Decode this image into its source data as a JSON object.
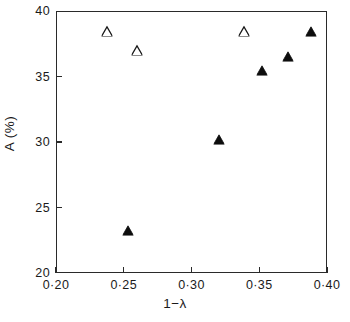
{
  "chart_data": {
    "type": "scatter",
    "title": "",
    "subtitle": "",
    "xlabel": "1−λ",
    "ylabel": "A (%)",
    "xlim": [
      0.2,
      0.4
    ],
    "ylim": [
      20,
      40
    ],
    "xticks": [
      0.2,
      0.25,
      0.3,
      0.35,
      0.4
    ],
    "yticks": [
      20,
      25,
      30,
      35,
      40
    ],
    "xticklabels": [
      "0·20",
      "0·25",
      "0·30",
      "0·35",
      "0·40"
    ],
    "yticklabels": [
      "20",
      "25",
      "30",
      "35",
      "40"
    ],
    "grid": false,
    "legend": "none",
    "series": [
      {
        "name": "open-triangle",
        "marker": "triangle-open",
        "color": "#1a1a1a",
        "points": [
          {
            "x": 0.238,
            "y": 38.5
          },
          {
            "x": 0.26,
            "y": 37.0
          },
          {
            "x": 0.339,
            "y": 38.5
          }
        ]
      },
      {
        "name": "filled-triangle",
        "marker": "triangle-filled",
        "color": "#0d0d0d",
        "points": [
          {
            "x": 0.253,
            "y": 23.3
          },
          {
            "x": 0.32,
            "y": 30.2
          },
          {
            "x": 0.352,
            "y": 35.5
          },
          {
            "x": 0.371,
            "y": 36.6
          },
          {
            "x": 0.388,
            "y": 38.5
          }
        ]
      }
    ]
  },
  "axes": {
    "frame_color": "#2a2a2a",
    "tick_color": "#2a2a2a"
  }
}
